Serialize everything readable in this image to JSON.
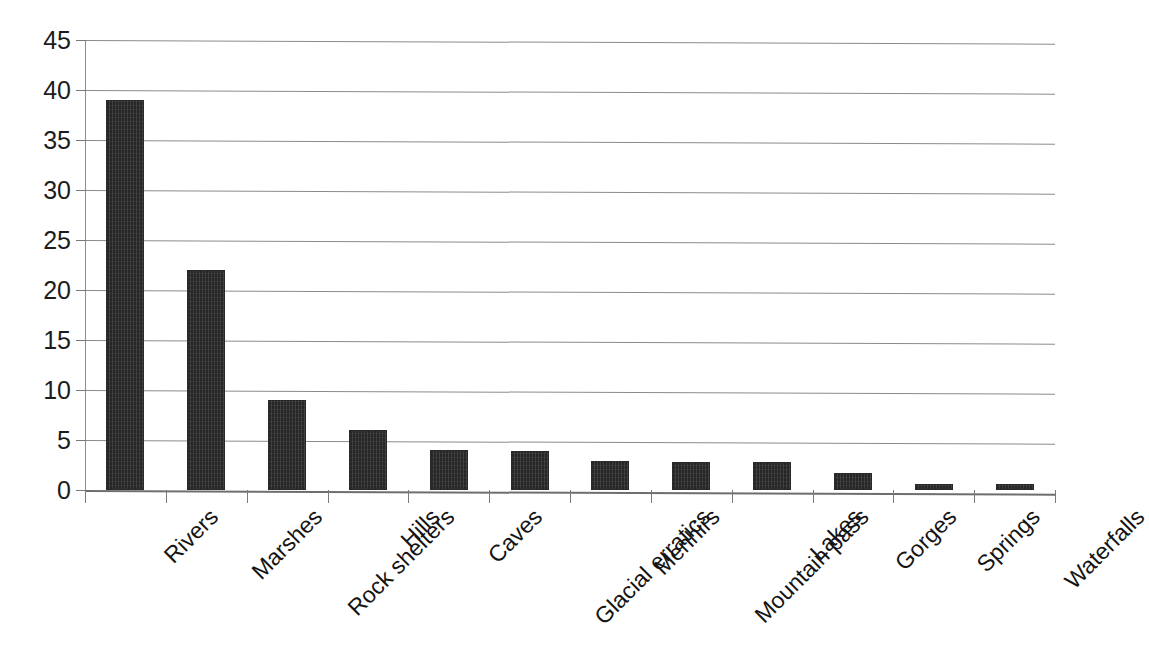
{
  "chart_data": {
    "type": "bar",
    "title": "",
    "subtitle": "",
    "xlabel": "",
    "ylabel": "",
    "legend": [],
    "legend_position": "none",
    "grid": true,
    "orientation": "vertical",
    "ylim": [
      0,
      45
    ],
    "ytick_step": 5,
    "yticks": [
      45,
      40,
      35,
      30,
      25,
      20,
      15,
      10,
      5,
      0
    ],
    "ytick_labels": [
      "45",
      "40",
      "35",
      "30",
      "25",
      "20",
      "15",
      "10",
      "5",
      "0"
    ],
    "categories": [
      "Rivers",
      "Marshes",
      "Rock shelters",
      "Hills",
      "Caves",
      "Glacial erratics",
      "Menhirs",
      "Mountain pass",
      "Lakes",
      "Gorges",
      "Springs",
      "Waterfalls"
    ],
    "values": [
      39,
      22,
      9,
      6,
      4,
      3.9,
      2.9,
      2.8,
      2.8,
      1.7,
      0.6,
      0.6
    ],
    "series": [
      {
        "name": "Count",
        "values": [
          39,
          22,
          9,
          6,
          4,
          3.9,
          2.9,
          2.8,
          2.8,
          1.7,
          0.6,
          0.6
        ]
      }
    ],
    "bar_color": "#262626",
    "grid_color": "#8b8b8b",
    "axis_color": "#7a7a7a",
    "background_color": "#ffffff",
    "annotations": []
  }
}
